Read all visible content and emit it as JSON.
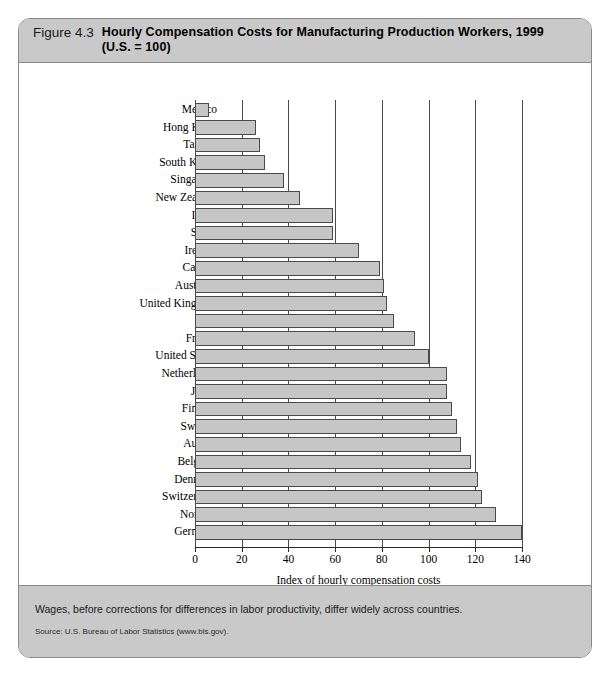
{
  "figure": {
    "number": "Figure 4.3",
    "title_line1": "Hourly Compensation Costs for Manufacturing Production Workers, 1999",
    "title_line2": "(U.S.  =  100)",
    "caption": "Wages, before corrections for differences in labor productivity, differ widely across countries.",
    "source": "Source: U.S. Bureau of Labor Statistics (www.bls.gov)."
  },
  "colors": {
    "panel_gray": "#c9c9c9",
    "bar_fill": "#c6c6c6",
    "bar_stroke": "#4a4a4a",
    "border": "#8a8a8a"
  },
  "chart_data": {
    "type": "bar",
    "orientation": "horizontal",
    "title": "Hourly Compensation Costs for Manufacturing Production Workers, 1999 (U.S. = 100)",
    "xlabel": "Index of hourly compensation costs",
    "ylabel": "",
    "xlim": [
      0,
      140
    ],
    "xticks": [
      0,
      20,
      40,
      60,
      80,
      100,
      120,
      140
    ],
    "grid": true,
    "grid_axis": "x",
    "legend": false,
    "categories": [
      "Mexico",
      "Hong Kong",
      "Taiwan",
      "South Korea",
      "Singapore",
      "New Zealand",
      "Israel",
      "Spain",
      "Ireland",
      "Canada",
      "Australia",
      "United Kingdom",
      "Italy",
      "France",
      "United States",
      "Netherlands",
      "Japan",
      "Finland",
      "Sweden",
      "Austria",
      "Belgium",
      "Denmark",
      "Switzerland",
      "Norway",
      "Germany"
    ],
    "values": [
      6,
      26,
      28,
      30,
      38,
      45,
      59,
      59,
      70,
      79,
      81,
      82,
      85,
      94,
      100,
      108,
      108,
      110,
      112,
      114,
      118,
      121,
      123,
      129,
      140
    ]
  }
}
